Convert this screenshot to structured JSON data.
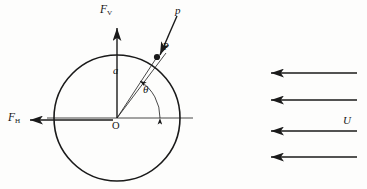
{
  "figure": {
    "background_color": "#fdfdfc",
    "ink_color": "#1a1a1a"
  },
  "labels": {
    "force_vertical": "F",
    "force_vertical_sub": "V",
    "force_horizontal": "F",
    "force_horizontal_sub": "H",
    "pressure": "p",
    "point": "P",
    "radius": "a",
    "angle": "θ",
    "origin": "O",
    "freestream": "U"
  },
  "geometry": {
    "circle": {
      "cx": 117,
      "cy": 118,
      "r": 63
    },
    "point_P": {
      "x": 158,
      "y": 57
    },
    "angle_degrees": 56,
    "axis_line": {
      "x1": 47,
      "x2": 193,
      "y": 118
    },
    "fv_arrow": {
      "x": 117,
      "y_tail": 118,
      "y_head": 27
    },
    "fh_arrow": {
      "y": 120,
      "x_tail": 113,
      "x_head": 28
    },
    "p_arrow": {
      "x_tail": 176,
      "y_tail": 17,
      "x_head": 160,
      "y_head": 55
    }
  },
  "freestream_arrows": {
    "count": 4,
    "direction": "left",
    "x_tail": 357,
    "x_head": 269,
    "y_positions": [
      73,
      100,
      131,
      157
    ],
    "label": "U"
  }
}
